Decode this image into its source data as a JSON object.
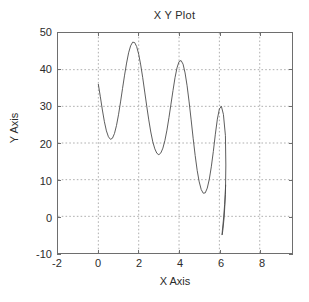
{
  "figure": {
    "title": "X Y Plot",
    "background_color": "#ffffff",
    "axes_color": "#6e6e6e",
    "grid_color": "#9a9a9a",
    "line_color": "#4a4a4a",
    "text_color": "#2b2b2b"
  },
  "axes": {
    "xlabel": "X Axis",
    "ylabel": "Y Axis",
    "xticks": [
      "-2",
      "0",
      "2",
      "4",
      "6",
      "8"
    ],
    "yticks": [
      "50",
      "40",
      "30",
      "20",
      "10",
      "0",
      "-10"
    ],
    "xlim": [
      -2,
      9.6
    ],
    "ylim": [
      -10,
      50
    ],
    "grid": true,
    "grid_style": "dotted",
    "box": true
  },
  "chart_data": {
    "type": "line",
    "title": "X Y Plot",
    "xlabel": "X Axis",
    "ylabel": "Y Axis",
    "xlim": [
      -2,
      9.6
    ],
    "ylim": [
      -10,
      50
    ],
    "xticks": [
      -2,
      0,
      2,
      4,
      6,
      8
    ],
    "yticks": [
      -10,
      0,
      10,
      20,
      30,
      40,
      50
    ],
    "grid": true,
    "legend": null,
    "series": [
      {
        "name": "curve",
        "color": "#4a4a4a",
        "x": [
          0.0,
          0.1,
          0.2,
          0.3,
          0.4,
          0.5,
          0.6,
          0.7,
          0.8,
          0.9,
          1.0,
          1.1,
          1.2,
          1.3,
          1.4,
          1.5,
          1.6,
          1.7,
          1.8,
          1.9,
          2.0,
          2.1,
          2.2,
          2.3,
          2.4,
          2.5,
          2.6,
          2.7,
          2.8,
          2.9,
          3.0,
          3.1,
          3.2,
          3.3,
          3.4,
          3.5,
          3.6,
          3.7,
          3.8,
          3.9,
          4.0,
          4.1,
          4.2,
          4.3,
          4.4,
          4.5,
          4.6,
          4.7,
          4.8,
          4.9,
          5.0,
          5.1,
          5.2,
          5.3,
          5.4,
          5.5,
          5.6,
          5.7,
          5.8,
          5.9,
          6.0,
          6.1,
          6.2,
          6.3
        ],
        "y": [
          36.0,
          32.6,
          29.0,
          25.8,
          23.3,
          21.7,
          21.0,
          21.3,
          22.6,
          24.8,
          27.7,
          31.2,
          34.9,
          38.5,
          41.8,
          44.6,
          46.5,
          47.5,
          47.4,
          46.3,
          44.2,
          41.3,
          37.8,
          33.9,
          30.0,
          26.3,
          23.0,
          20.3,
          18.4,
          17.2,
          16.8,
          17.3,
          18.6,
          20.7,
          23.5,
          26.9,
          30.6,
          34.3,
          37.8,
          40.5,
          42.2,
          42.5,
          41.5,
          39.1,
          35.6,
          31.2,
          26.3,
          21.3,
          16.6,
          12.5,
          9.4,
          7.3,
          6.3,
          6.4,
          7.7,
          10.1,
          13.5,
          17.7,
          22.4,
          26.5,
          29.3,
          30.0,
          27.8,
          22.0
        ],
        "x_tail": [
          6.3,
          6.32,
          6.3,
          6.24,
          6.18,
          6.14,
          6.13,
          6.15,
          6.2,
          6.26,
          6.31
        ],
        "y_tail": [
          22.0,
          14.0,
          6.0,
          0.0,
          -3.4,
          -5.0,
          -5.1,
          -3.8,
          -1.0,
          3.2,
          8.5
        ]
      }
    ]
  }
}
